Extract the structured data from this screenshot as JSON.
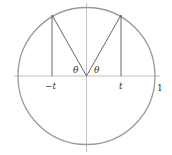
{
  "diagram": {
    "labels": {
      "neg_t": "−t",
      "pos_t": "t",
      "one": "1",
      "theta_left": "θ",
      "theta_right": "θ"
    },
    "colors": {
      "circle": "#9a9a9a",
      "axis": "#b0b0b0",
      "lines": "#555555",
      "text": "#333333"
    }
  }
}
